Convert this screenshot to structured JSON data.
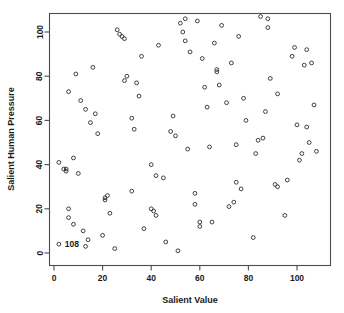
{
  "chart_data": {
    "type": "scatter",
    "title": "",
    "xlabel": "Salient Value",
    "ylabel": "Salient Human Pressure",
    "xlim": [
      -2,
      113
    ],
    "ylim": [
      -3,
      112
    ],
    "xticks": [
      0,
      20,
      40,
      60,
      80,
      100
    ],
    "yticks": [
      0,
      20,
      40,
      60,
      80,
      100
    ],
    "xtick_labels": [
      "0",
      "20",
      "40",
      "60",
      "80",
      "100"
    ],
    "ytick_labels": [
      "0",
      "20",
      "40",
      "60",
      "80",
      "100"
    ],
    "grid": false,
    "legend": null,
    "marker": "open-circle",
    "marker_color": "#2b2b2b",
    "frame_color": "#4d4d4d",
    "annotations": [
      {
        "text": "108",
        "x": 2,
        "y": 4,
        "anchor": "left"
      }
    ],
    "points": [
      [
        2,
        41
      ],
      [
        2,
        4
      ],
      [
        5,
        37
      ],
      [
        4,
        38
      ],
      [
        5,
        38
      ],
      [
        6,
        73
      ],
      [
        6,
        20
      ],
      [
        6,
        16
      ],
      [
        8,
        43
      ],
      [
        8,
        13
      ],
      [
        9,
        81
      ],
      [
        10,
        36
      ],
      [
        11,
        69
      ],
      [
        12,
        10
      ],
      [
        13,
        3
      ],
      [
        13,
        65
      ],
      [
        14,
        6
      ],
      [
        15,
        59
      ],
      [
        16,
        84
      ],
      [
        17,
        63
      ],
      [
        18,
        54
      ],
      [
        20,
        8
      ],
      [
        21,
        24
      ],
      [
        21,
        25
      ],
      [
        22,
        26
      ],
      [
        23,
        18
      ],
      [
        25,
        2
      ],
      [
        26,
        101
      ],
      [
        27,
        99
      ],
      [
        28,
        98
      ],
      [
        29,
        97
      ],
      [
        29,
        78
      ],
      [
        30,
        80
      ],
      [
        32,
        61
      ],
      [
        32,
        28
      ],
      [
        33,
        56
      ],
      [
        34,
        77
      ],
      [
        35,
        71
      ],
      [
        36,
        89
      ],
      [
        37,
        11
      ],
      [
        40,
        40
      ],
      [
        40,
        20
      ],
      [
        41,
        19
      ],
      [
        42,
        35
      ],
      [
        42,
        17
      ],
      [
        43,
        94
      ],
      [
        45,
        34
      ],
      [
        46,
        5
      ],
      [
        48,
        55
      ],
      [
        49,
        62
      ],
      [
        50,
        53
      ],
      [
        51,
        1
      ],
      [
        52,
        104
      ],
      [
        53,
        100
      ],
      [
        54,
        106
      ],
      [
        54,
        96
      ],
      [
        55,
        47
      ],
      [
        56,
        91
      ],
      [
        58,
        27
      ],
      [
        58,
        22
      ],
      [
        59,
        105
      ],
      [
        60,
        12
      ],
      [
        60,
        14
      ],
      [
        61,
        88
      ],
      [
        62,
        75
      ],
      [
        63,
        66
      ],
      [
        64,
        48
      ],
      [
        65,
        14
      ],
      [
        66,
        95
      ],
      [
        67,
        83
      ],
      [
        67,
        82
      ],
      [
        68,
        76
      ],
      [
        69,
        103
      ],
      [
        71,
        68
      ],
      [
        72,
        21
      ],
      [
        73,
        86
      ],
      [
        74,
        23
      ],
      [
        75,
        32
      ],
      [
        75,
        49
      ],
      [
        76,
        98
      ],
      [
        77,
        29
      ],
      [
        78,
        70
      ],
      [
        79,
        60
      ],
      [
        82,
        7
      ],
      [
        83,
        45
      ],
      [
        84,
        51
      ],
      [
        85,
        107
      ],
      [
        86,
        52
      ],
      [
        87,
        64
      ],
      [
        88,
        106
      ],
      [
        88,
        102
      ],
      [
        89,
        79
      ],
      [
        91,
        31
      ],
      [
        92,
        30
      ],
      [
        92,
        72
      ],
      [
        95,
        17
      ],
      [
        96,
        33
      ],
      [
        98,
        89
      ],
      [
        99,
        93
      ],
      [
        100,
        58
      ],
      [
        101,
        42
      ],
      [
        102,
        45
      ],
      [
        103,
        85
      ],
      [
        104,
        92
      ],
      [
        104,
        57
      ],
      [
        105,
        50
      ],
      [
        106,
        86
      ],
      [
        107,
        67
      ],
      [
        108,
        46
      ]
    ]
  }
}
